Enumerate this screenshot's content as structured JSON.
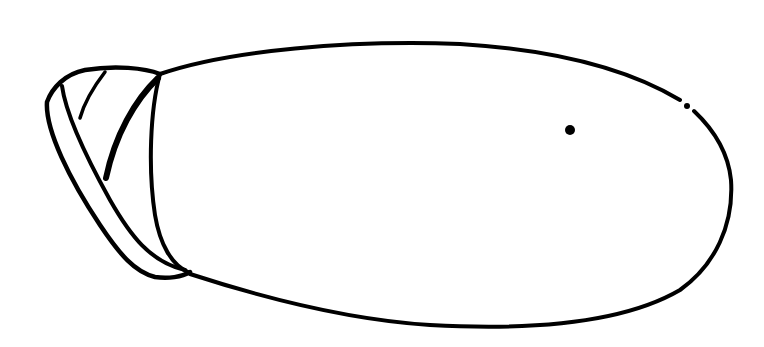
{
  "figure": {
    "stroke_color": "#000000",
    "background_color": "#ffffff"
  }
}
